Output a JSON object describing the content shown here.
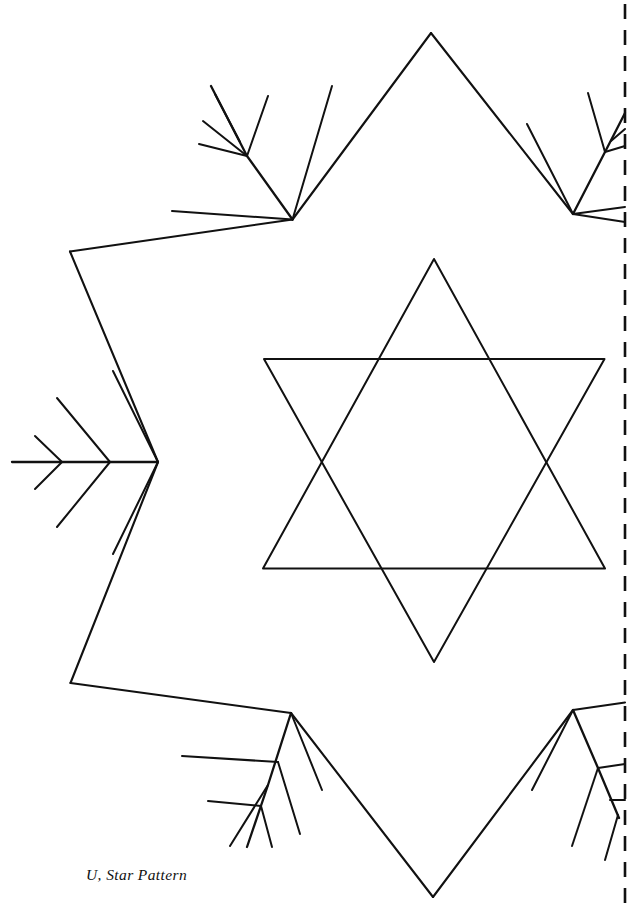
{
  "page": {
    "width": 640,
    "height": 909,
    "background_color": "#ffffff",
    "ink_color": "#111111"
  },
  "caption": {
    "text": "U, Star Pattern",
    "label": "U",
    "title": "Star Pattern"
  },
  "figure": {
    "name": "star-pattern-figure",
    "fold_line": {
      "name": "fold-line",
      "orientation": "vertical",
      "x": 625,
      "y_start": 4,
      "y_end": 905,
      "style": "dashed"
    },
    "outer_outline": {
      "name": "snowflake-outline",
      "points": [
        [
          431,
          33
        ],
        [
          292,
          219
        ],
        [
          70,
          251
        ],
        [
          158,
          462
        ],
        [
          70,
          683
        ],
        [
          291,
          713
        ],
        [
          433,
          897
        ],
        [
          573,
          710
        ],
        [
          625,
          703
        ],
        [
          625,
          222
        ],
        [
          573,
          214
        ]
      ]
    },
    "center_star": {
      "name": "hexagram",
      "triangle_up": [
        [
          434,
          259
        ],
        [
          604,
          568
        ],
        [
          263,
          568
        ]
      ],
      "triangle_down": [
        [
          264,
          359
        ],
        [
          604,
          359
        ],
        [
          434,
          662
        ]
      ]
    },
    "feathers": [
      {
        "name": "feather-left",
        "position": "left-point",
        "spine": [
          [
            12,
            462
          ],
          [
            158,
            462
          ]
        ],
        "barb_pairs": 3
      },
      {
        "name": "feather-top-left",
        "position": "upper-left-notch",
        "spine": [
          [
            292,
            219
          ],
          [
            210,
            86
          ]
        ],
        "barb_pairs": 3
      },
      {
        "name": "feather-bottom-left",
        "position": "lower-left-notch",
        "spine": [
          [
            291,
            713
          ],
          [
            247,
            846
          ]
        ],
        "barb_pairs": 3
      },
      {
        "name": "feather-top-right",
        "position": "upper-right-notch",
        "spine": [
          [
            573,
            214
          ],
          [
            617,
            86
          ]
        ],
        "barb_pairs": 3
      },
      {
        "name": "feather-bottom-right",
        "position": "lower-right-notch",
        "spine": [
          [
            573,
            710
          ],
          [
            617,
            846
          ]
        ],
        "barb_pairs": 3
      }
    ]
  }
}
